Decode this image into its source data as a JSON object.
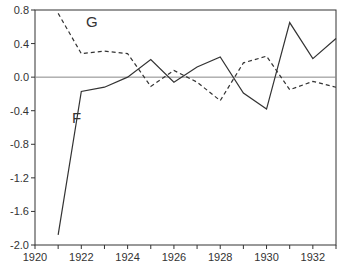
{
  "chart_data": {
    "type": "line",
    "title": "",
    "xlabel": "",
    "ylabel": "",
    "xlim": [
      1920,
      1933
    ],
    "ylim": [
      -2.0,
      0.8
    ],
    "x_ticks": [
      "1920",
      "1922",
      "1924",
      "1926",
      "1928",
      "1930",
      "1932"
    ],
    "y_ticks": [
      "0.8",
      "0.4",
      "0.0",
      "-0.4",
      "-0.8",
      "-1.2",
      "-1.6",
      "-2.0"
    ],
    "x": [
      1921,
      1922,
      1923,
      1924,
      1925,
      1926,
      1927,
      1928,
      1929,
      1930,
      1931,
      1932,
      1933
    ],
    "series": [
      {
        "name": "F",
        "style": "solid",
        "values": [
          -1.88,
          -0.17,
          -0.12,
          0.0,
          0.21,
          -0.06,
          0.12,
          0.24,
          -0.19,
          -0.38,
          0.65,
          0.22,
          0.46
        ]
      },
      {
        "name": "G",
        "style": "dashed",
        "values": [
          0.76,
          0.28,
          0.31,
          0.28,
          -0.11,
          0.08,
          -0.06,
          -0.28,
          0.17,
          0.25,
          -0.15,
          -0.05,
          -0.12
        ]
      }
    ],
    "annotations": [
      {
        "text": "G",
        "x": 1922.2,
        "y": 0.6
      },
      {
        "text": "F",
        "x": 1921.6,
        "y": -0.55
      }
    ],
    "zero_line": true,
    "grid": false
  }
}
